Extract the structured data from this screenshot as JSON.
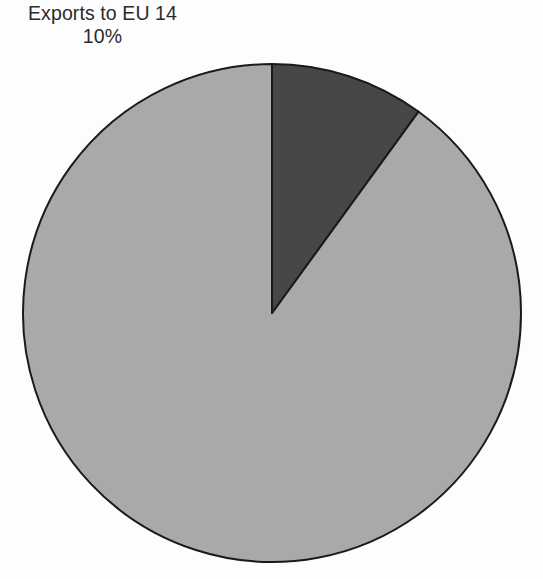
{
  "figure": {
    "background_color": "#fdfdfd",
    "annotation": {
      "line1": "Exports to EU 14",
      "line2": "10%"
    }
  },
  "chart_data": {
    "type": "pie",
    "title": "Exports to EU 14",
    "xlabel": "",
    "ylabel": "",
    "labels": [
      "Exports to EU 14",
      "Other"
    ],
    "values": [
      10,
      90
    ],
    "value_labels": [
      "10%",
      ""
    ],
    "units": "percent",
    "colors": [
      "#474747",
      "#a9a9a9"
    ],
    "slice_outline_color": "#1a1a1a",
    "slice_outline_width": 2,
    "start_angle_deg": 90,
    "direction": "counterclockwise",
    "legend": "none",
    "grid": false,
    "center_x": 272,
    "center_y": 313,
    "radius": 249,
    "annotations": [
      {
        "text": "Exports to EU 14",
        "refers_to": "Exports to EU 14",
        "position": "top-left"
      },
      {
        "text": "10%",
        "refers_to": "Exports to EU 14",
        "position": "top-left"
      }
    ]
  }
}
